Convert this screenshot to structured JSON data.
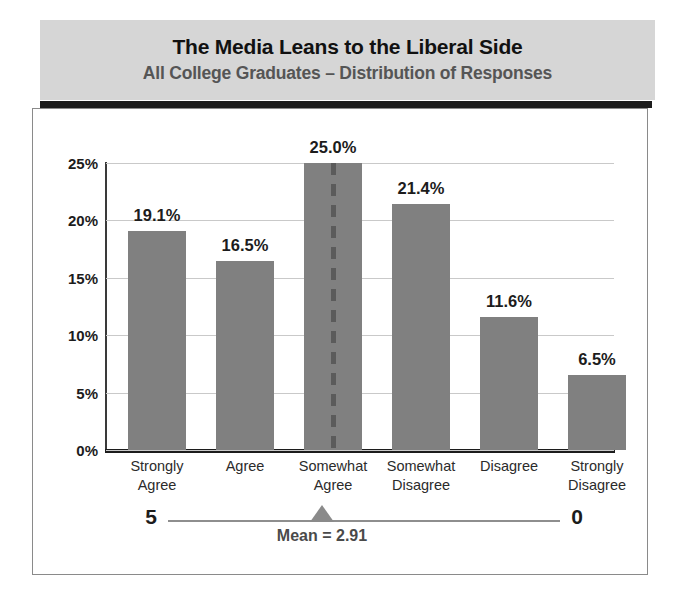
{
  "chart_data": {
    "type": "bar",
    "title": "The Media Leans to the Liberal Side",
    "subtitle": "All College Graduates – Distribution of Responses",
    "categories": [
      "Strongly\nAgree",
      "Agree",
      "Somewhat\nAgree",
      "Somewhat\nDisagree",
      "Disagree",
      "Strongly\nDisagree"
    ],
    "category_lines": [
      [
        "Strongly",
        "Agree"
      ],
      [
        "Agree",
        ""
      ],
      [
        "Somewhat",
        "Agree"
      ],
      [
        "Somewhat",
        "Disagree"
      ],
      [
        "Disagree",
        ""
      ],
      [
        "Strongly",
        "Disagree"
      ]
    ],
    "values": [
      19.1,
      16.5,
      25.0,
      21.4,
      11.6,
      6.5
    ],
    "value_labels": [
      "19.1%",
      "16.5%",
      "25.0%",
      "21.4%",
      "11.6%",
      "6.5%"
    ],
    "xlabel": "",
    "ylabel": "",
    "ylim": [
      0,
      25
    ],
    "yticks": [
      0,
      5,
      10,
      15,
      20,
      25
    ],
    "ytick_labels": [
      "0%",
      "5%",
      "10%",
      "15%",
      "20%",
      "25%"
    ],
    "grid": true,
    "legend": false,
    "bar_color": "#808080",
    "annotations": {
      "mean_line_category": "Somewhat Agree",
      "mean_label": "Mean = 2.91",
      "mean_value": 2.91,
      "scale_left": "5",
      "scale_right": "0",
      "scale_min": 0,
      "scale_max": 5
    }
  },
  "colors": {
    "banner_background": "#d6d6d6",
    "rule": "#1c1c1c",
    "bar": "#808080",
    "gridline": "#c9c9c9",
    "title_text": "#111111",
    "subtitle_text": "#555555",
    "marker": "#8a8a8a",
    "frame_border": "#8a8a8a"
  }
}
